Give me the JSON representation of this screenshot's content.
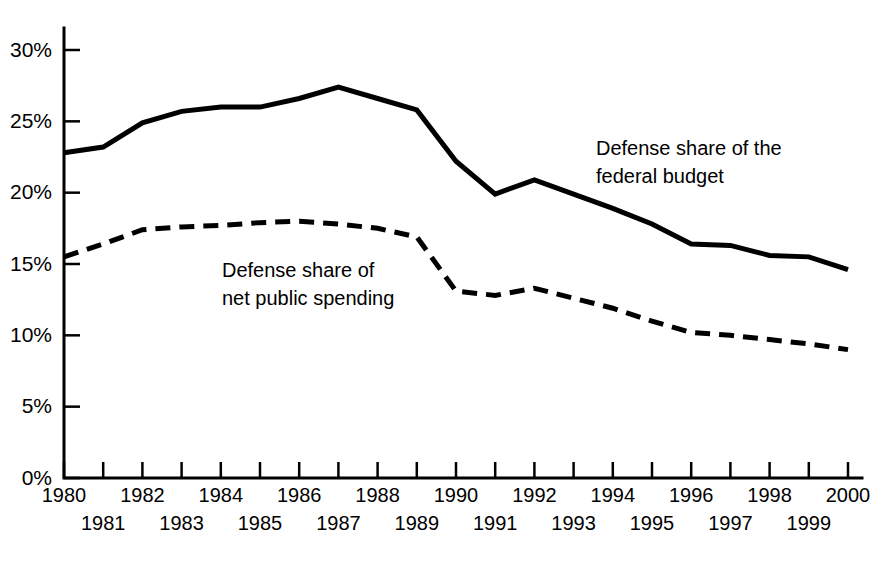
{
  "chart_data": {
    "type": "line",
    "title": "",
    "subtitle": "",
    "xlabel": "",
    "ylabel": "",
    "x": [
      1980,
      1981,
      1982,
      1983,
      1984,
      1985,
      1986,
      1987,
      1988,
      1989,
      1990,
      1991,
      1992,
      1993,
      1994,
      1995,
      1996,
      1997,
      1998,
      1999,
      2000
    ],
    "xlim": [
      1980,
      2000
    ],
    "ylim": [
      0,
      30
    ],
    "grid": false,
    "legend_position": "inline-annotation",
    "y_ticks": [
      0,
      5,
      10,
      15,
      20,
      25,
      30
    ],
    "y_tick_labels": [
      "0%",
      "5%",
      "10%",
      "15%",
      "20%",
      "25%",
      "30%"
    ],
    "x_tick_labels": [
      "1980",
      "1981",
      "1982",
      "1983",
      "1984",
      "1985",
      "1986",
      "1987",
      "1988",
      "1989",
      "1990",
      "1991",
      "1992",
      "1993",
      "1994",
      "1995",
      "1996",
      "1997",
      "1998",
      "1999",
      "2000"
    ],
    "series": [
      {
        "name": "Defense share of the federal budget",
        "style": "solid",
        "color": "#000000",
        "annotation": "Defense share of the\nfederal budget",
        "annotation_line1": "Defense share of the",
        "annotation_line2": "federal budget",
        "values": [
          22.8,
          23.2,
          24.9,
          25.7,
          26.0,
          26.0,
          26.6,
          27.4,
          26.6,
          25.8,
          22.2,
          19.9,
          20.9,
          19.9,
          18.9,
          17.8,
          16.4,
          16.3,
          15.6,
          15.5,
          14.6
        ]
      },
      {
        "name": "Defense share of net public spending",
        "style": "dashed",
        "color": "#000000",
        "annotation": "Defense share of\nnet public spending",
        "annotation_line1": "Defense share of",
        "annotation_line2": "net public spending",
        "values": [
          15.5,
          16.4,
          17.4,
          17.6,
          17.7,
          17.9,
          18.0,
          17.8,
          17.5,
          16.9,
          13.1,
          12.8,
          13.3,
          12.6,
          11.9,
          11.0,
          10.2,
          10.0,
          9.7,
          9.4,
          9.0
        ]
      }
    ]
  },
  "annotations": {
    "federal_budget": {
      "line1": "Defense share of the",
      "line2": "federal budget",
      "x": 596,
      "y": 155
    },
    "net_public_spending": {
      "line1": "Defense share of",
      "line2": "net public spending",
      "x": 222,
      "y": 277
    }
  }
}
